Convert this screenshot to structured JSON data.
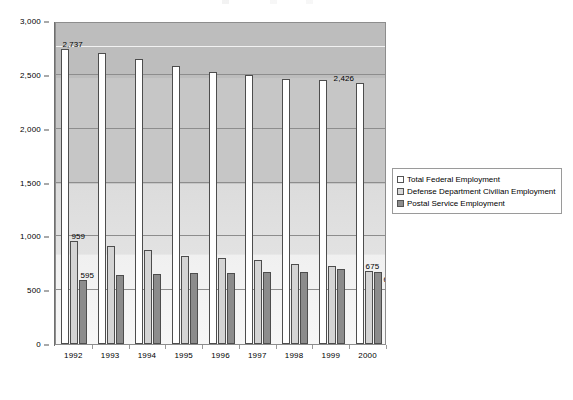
{
  "chart_data": {
    "type": "bar",
    "title": "",
    "subtitle": "",
    "xlabel": "",
    "ylabel": "",
    "categories": [
      "1992",
      "1993",
      "1994",
      "1995",
      "1996",
      "1997",
      "1998",
      "1999",
      "2000"
    ],
    "ylim": [
      0,
      3000
    ],
    "yticks": [
      0,
      500,
      1000,
      1500,
      2000,
      2500,
      3000
    ],
    "ytick_labels": [
      "0",
      "500",
      "1,000",
      "1,500",
      "2,000",
      "2,500",
      "3,000"
    ],
    "grid": true,
    "legend_position": "right",
    "series": [
      {
        "name": "Total Federal Employment",
        "color": "#ffffff",
        "values": [
          2737,
          2706,
          2644,
          2582,
          2531,
          2495,
          2460,
          2455,
          2426
        ]
      },
      {
        "name": "Defense Department Civilian Employment",
        "color": "#d4d4d4",
        "values": [
          959,
          911,
          875,
          822,
          800,
          778,
          747,
          720,
          675
        ]
      },
      {
        "name": "Postal Service Employment",
        "color": "#8c8c8c",
        "values": [
          595,
          638,
          648,
          661,
          664,
          670,
          671,
          700,
          672
        ]
      }
    ],
    "annotations": [
      {
        "text": "2,737",
        "series": 0,
        "category": "1992"
      },
      {
        "text": "2,426",
        "series": 0,
        "category": "2000"
      },
      {
        "text": "959",
        "series": 1,
        "category": "1992"
      },
      {
        "text": "675",
        "series": 1,
        "category": "2000"
      },
      {
        "text": "595",
        "series": 2,
        "category": "1992"
      },
      {
        "text": "672",
        "series": 2,
        "category": "2000"
      }
    ]
  },
  "legend": {
    "items": [
      {
        "label": "Total Federal Employment"
      },
      {
        "label": "Defense Department Civilian Employment"
      },
      {
        "label": "Postal Service Employment"
      }
    ]
  }
}
